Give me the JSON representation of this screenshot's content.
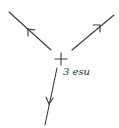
{
  "diagram": {
    "type": "electric-field-lines",
    "charge": {
      "symbol": "+",
      "label": "3 esu",
      "position": [
        61,
        59
      ]
    },
    "field_lines": [
      {
        "name": "upper-left",
        "from": [
          51,
          50
        ],
        "to": [
          9,
          12
        ],
        "arrow_direction": "outward"
      },
      {
        "name": "upper-right",
        "from": [
          72,
          50
        ],
        "to": [
          114,
          15
        ],
        "arrow_direction": "outward"
      },
      {
        "name": "lower",
        "from": [
          57,
          68
        ],
        "to": [
          45,
          125
        ],
        "arrow_direction": "outward"
      }
    ],
    "ink_color": "#3a3a3a",
    "background": "#ffffff"
  }
}
